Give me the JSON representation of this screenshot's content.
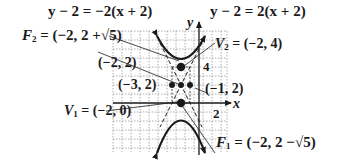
{
  "diagram": {
    "type": "hyperbola-graph",
    "axes": {
      "x_label": "x",
      "y_label": "y",
      "x_tick_label": "2",
      "y_tick_label": "4"
    },
    "asymptotes": [
      {
        "equation": "y − 2 = −2(x + 2)"
      },
      {
        "equation": "y − 2 = 2(x + 2)"
      }
    ],
    "points": {
      "F2": {
        "name": "F",
        "sub": "2",
        "value": " = (−2, 2 +√5)"
      },
      "V2": {
        "name": "V",
        "sub": "2",
        "value": " = (−2, 4)"
      },
      "center": {
        "label": "(−2, 2)"
      },
      "left": {
        "label": "(−3, 2)"
      },
      "right": {
        "label": "(−1, 2)"
      },
      "V1": {
        "name": "V",
        "sub": "1",
        "value": " = (−2, 0)"
      },
      "F1": {
        "name": "F",
        "sub": "1",
        "value": " = (−2, 2 −√5)"
      }
    },
    "colors": {
      "ink": "#1a1a1a",
      "grid": "#9a9a9a",
      "background": "#ffffff"
    }
  }
}
